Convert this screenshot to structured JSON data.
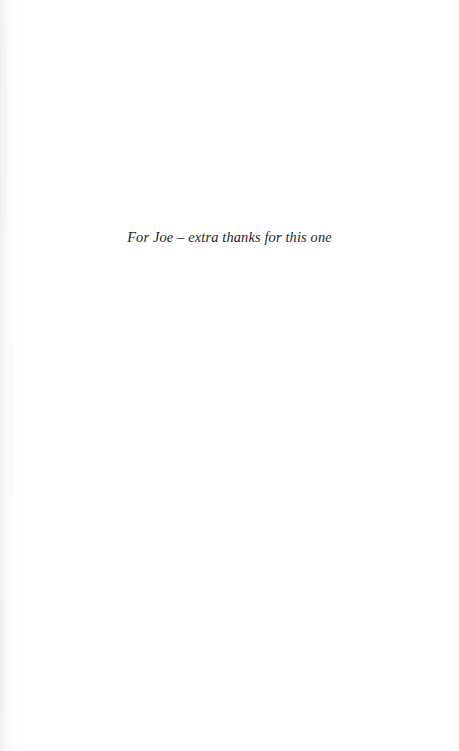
{
  "page": {
    "kind": "book-dedication-page",
    "background_color": "#ffffff",
    "width": 459,
    "height": 751
  },
  "dedication": {
    "text": "For Joe – extra thanks for this one",
    "style": "italic-serif",
    "alignment": "center",
    "text_color": "#25252a"
  },
  "artifacts": {
    "left_gutter_shadow_color": "#e4e4e8",
    "right_edge_tone_color": "#f6f6f8"
  }
}
